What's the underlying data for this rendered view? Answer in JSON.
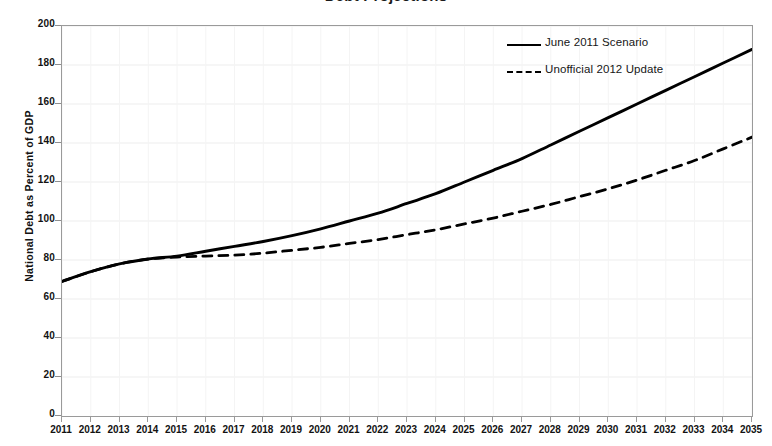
{
  "figure": {
    "title_cropped": "Debt Projections",
    "background": "#ffffff",
    "frame_color": "#9a9a9a",
    "grid_color": "#ededed",
    "series_color": "#000000"
  },
  "chart_data": {
    "type": "line",
    "title": "",
    "xlabel": "",
    "ylabel": "National Debt as Percent of GDP",
    "xlim": [
      2011,
      2035
    ],
    "ylim": [
      0,
      200
    ],
    "grid": true,
    "legend_position": "top-right",
    "x": [
      2011,
      2012,
      2013,
      2014,
      2015,
      2016,
      2017,
      2018,
      2019,
      2020,
      2021,
      2022,
      2023,
      2024,
      2025,
      2026,
      2027,
      2028,
      2029,
      2030,
      2031,
      2032,
      2033,
      2034,
      2035
    ],
    "categories": [
      "2011",
      "2012",
      "2013",
      "2014",
      "2015",
      "2016",
      "2017",
      "2018",
      "2019",
      "2020",
      "2021",
      "2022",
      "2023",
      "2024",
      "2025",
      "2026",
      "2027",
      "2028",
      "2029",
      "2030",
      "2031",
      "2032",
      "2033",
      "2034",
      "2035"
    ],
    "ytick_labels": [
      "0",
      "20",
      "40",
      "60",
      "80",
      "100",
      "120",
      "140",
      "160",
      "180",
      "200"
    ],
    "yticks": [
      0,
      20,
      40,
      60,
      80,
      100,
      120,
      140,
      160,
      180,
      200
    ],
    "series": [
      {
        "name": "June 2011 Scenario",
        "style": "solid",
        "color": "#000000",
        "values": [
          69,
          74,
          78,
          80.5,
          82,
          84.5,
          87,
          89.5,
          92.5,
          96,
          100,
          104,
          109,
          114,
          120,
          126,
          132,
          139,
          146,
          153,
          160,
          167,
          174,
          181,
          188
        ]
      },
      {
        "name": "Unofficial 2012 Update",
        "style": "dashed",
        "color": "#000000",
        "values": [
          69,
          74,
          78,
          80.5,
          81.5,
          82,
          82.5,
          83.5,
          85,
          86.5,
          88.5,
          90.5,
          93,
          95.5,
          98.5,
          101.5,
          105,
          108.5,
          112.5,
          116.5,
          121,
          126,
          131,
          137,
          143
        ]
      }
    ]
  },
  "legend": {
    "items": [
      {
        "label": "June 2011 Scenario",
        "style": "solid"
      },
      {
        "label": "Unofficial 2012 Update",
        "style": "dashed"
      }
    ]
  }
}
